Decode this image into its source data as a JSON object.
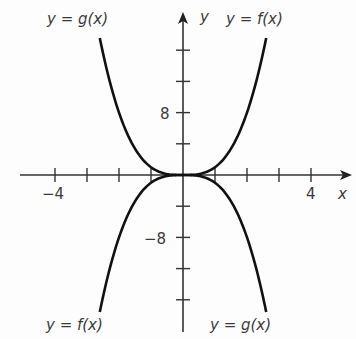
{
  "chart_data": {
    "type": "line",
    "title": "",
    "xlabel": "x",
    "ylabel": "y",
    "xlim": [
      -5,
      5
    ],
    "ylim": [
      -20,
      20
    ],
    "x_ticks": [
      -4,
      -3,
      -2,
      -1,
      1,
      2,
      3,
      4
    ],
    "x_tick_labels": [
      {
        "value": -4,
        "label": "−4"
      },
      {
        "value": 4,
        "label": "4"
      }
    ],
    "y_ticks": [
      -16,
      -12,
      -8,
      -4,
      4,
      8,
      12,
      16
    ],
    "y_tick_labels": [
      {
        "value": 8,
        "label": "8"
      },
      {
        "value": -8,
        "label": "−8"
      }
    ],
    "grid": false,
    "series": [
      {
        "name": "y = f(x)",
        "formula": "x^3",
        "x": [
          -2.6,
          -2,
          -1,
          0,
          1,
          2,
          2.6
        ],
        "y": [
          -17.6,
          -8,
          -1,
          0,
          1,
          8,
          17.6
        ]
      },
      {
        "name": "y = g(x)",
        "formula": "-x^3",
        "x": [
          -2.6,
          -2,
          -1,
          0,
          1,
          2,
          2.6
        ],
        "y": [
          17.6,
          8,
          1,
          0,
          -1,
          -8,
          -17.6
        ]
      }
    ],
    "annotations": [
      {
        "text": "y = g(x)",
        "position": "top-left"
      },
      {
        "text": "y = f(x)",
        "position": "top-right"
      },
      {
        "text": "y = f(x)",
        "position": "bottom-left"
      },
      {
        "text": "y = g(x)",
        "position": "bottom-right"
      }
    ]
  },
  "labels": {
    "x_axis": "x",
    "y_axis": "y",
    "x_neg4": "−4",
    "x_pos4": "4",
    "y_pos8": "8",
    "y_neg8": "−8",
    "g_top": "y = g(x)",
    "f_top": "y = f(x)",
    "f_bottom": "y = f(x)",
    "g_bottom": "y = g(x)"
  },
  "colors": {
    "axis": "#333333",
    "curve": "#111111",
    "text": "#3a3a3a"
  }
}
